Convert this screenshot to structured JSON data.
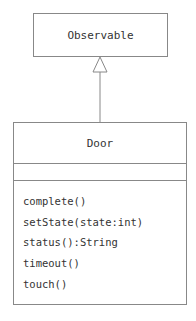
{
  "diagram": {
    "type": "uml-class",
    "classes": [
      {
        "name": "Observable",
        "attributes": [],
        "methods": []
      },
      {
        "name": "Door",
        "attributes": [],
        "methods": [
          "complete()",
          "setState(state:int)",
          "status():String",
          "timeout()",
          "touch()"
        ]
      }
    ],
    "relations": [
      {
        "from": "Door",
        "to": "Observable",
        "kind": "generalization"
      }
    ]
  }
}
